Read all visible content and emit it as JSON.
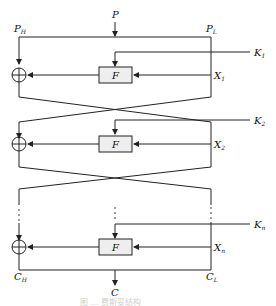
{
  "diagram": {
    "title_type": "Feistel cipher structure",
    "input": "P",
    "output": "C",
    "left_input": {
      "base": "P",
      "sub": "H"
    },
    "right_input": {
      "base": "P",
      "sub": "L"
    },
    "left_output": {
      "base": "C",
      "sub": "H"
    },
    "right_output": {
      "base": "C",
      "sub": "L"
    },
    "rounds": [
      {
        "function": "F",
        "key": {
          "base": "K",
          "sub": "1"
        },
        "x": {
          "base": "X",
          "sub": "1"
        }
      },
      {
        "function": "F",
        "key": {
          "base": "K",
          "sub": "2"
        },
        "x": {
          "base": "X",
          "sub": "2"
        }
      },
      {
        "function": "F",
        "key": {
          "base": "K",
          "sub": "n"
        },
        "x": {
          "base": "X",
          "sub": "n"
        }
      }
    ],
    "caption": "图 … 费斯妥结构"
  }
}
